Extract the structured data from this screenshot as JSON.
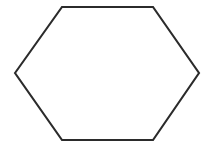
{
  "figure": {
    "shape_name": "regular-hexagon",
    "sector_count": 12,
    "background_color": "#ffffff",
    "outline_color": "#2b2b2b",
    "radial_color": "#4a4a4a",
    "outline_width": 2.1,
    "radial_width": 1.25,
    "canvas": {
      "width": 211,
      "height": 148
    },
    "center": {
      "x": 107,
      "y": 73
    },
    "vertices": [
      {
        "name": "left",
        "x": 15,
        "y": 73
      },
      {
        "name": "top-left",
        "x": 62,
        "y": 7
      },
      {
        "name": "top-right",
        "x": 153,
        "y": 7
      },
      {
        "name": "right",
        "x": 199,
        "y": 73
      },
      {
        "name": "bottom-right",
        "x": 153,
        "y": 140
      },
      {
        "name": "bottom-left",
        "x": 62,
        "y": 140
      }
    ],
    "edge_points": [
      {
        "name": "top-midpoint",
        "x": 107,
        "y": 7
      },
      {
        "name": "bottom-midpoint",
        "x": 107,
        "y": 140
      },
      {
        "name": "upper-left-edge-point",
        "x": 39,
        "y": 40
      },
      {
        "name": "upper-right-edge-point",
        "x": 176,
        "y": 40
      },
      {
        "name": "lower-left-edge-point",
        "x": 39,
        "y": 106
      },
      {
        "name": "lower-right-edge-point",
        "x": 176,
        "y": 106
      }
    ],
    "outline_path": "M15,73 L62,7 L153,7 L199,73 L153,140 L62,140 Z",
    "spokes": [
      {
        "name": "spoke-to-left-vertex",
        "x2": 15,
        "y2": 73
      },
      {
        "name": "spoke-to-upper-left-edge-point",
        "x2": 39,
        "y2": 40
      },
      {
        "name": "spoke-to-top-left-vertex",
        "x2": 62,
        "y2": 7
      },
      {
        "name": "spoke-to-top-midpoint",
        "x2": 107,
        "y2": 7
      },
      {
        "name": "spoke-to-top-right-vertex",
        "x2": 153,
        "y2": 7
      },
      {
        "name": "spoke-to-upper-right-edge-point",
        "x2": 176,
        "y2": 40
      },
      {
        "name": "spoke-to-right-vertex",
        "x2": 199,
        "y2": 73
      },
      {
        "name": "spoke-to-lower-right-edge-point",
        "x2": 176,
        "y2": 106
      },
      {
        "name": "spoke-to-bottom-right-vertex",
        "x2": 153,
        "y2": 140
      },
      {
        "name": "spoke-to-bottom-midpoint",
        "x2": 107,
        "y2": 140
      },
      {
        "name": "spoke-to-bottom-left-vertex",
        "x2": 62,
        "y2": 140
      },
      {
        "name": "spoke-to-lower-left-edge-point",
        "x2": 39,
        "y2": 106
      }
    ]
  }
}
